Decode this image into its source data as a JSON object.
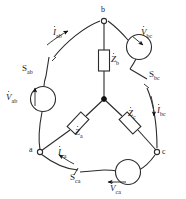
{
  "diagram": {
    "background_color": "#ffffff",
    "line_color": "#2b2b2b",
    "nodes": [
      {
        "id": "b",
        "label": "b",
        "type": "open-terminal",
        "x": 104,
        "y": 19
      },
      {
        "id": "a",
        "label": "a",
        "type": "open-terminal",
        "x": 39,
        "y": 152
      },
      {
        "id": "c",
        "label": "c",
        "type": "open-terminal",
        "x": 157,
        "y": 152
      },
      {
        "id": "n",
        "label": "",
        "type": "junction-dot",
        "x": 104,
        "y": 99
      }
    ],
    "sources": [
      {
        "id": "vab",
        "label": "V",
        "sub": "ab",
        "polarity_arrow": "up",
        "x": 43,
        "y": 99
      },
      {
        "id": "vbc",
        "label": "V",
        "sub": "bc",
        "polarity_arrow": "down-right",
        "x": 139,
        "y": 47
      },
      {
        "id": "vca",
        "label": "V",
        "sub": "ca",
        "polarity_arrow": "left",
        "x": 128,
        "y": 172
      }
    ],
    "impedances": [
      {
        "id": "zb",
        "label": "Z",
        "sub": "b",
        "orientation": "vertical",
        "x": 104,
        "y": 60
      },
      {
        "id": "za",
        "label": "Z",
        "sub": "a",
        "orientation": "diagonal-down-left",
        "x": 78,
        "y": 123
      },
      {
        "id": "zc",
        "label": "Z",
        "sub": "c",
        "orientation": "diagonal-down-right",
        "x": 130,
        "y": 123
      }
    ],
    "switches": [
      {
        "id": "sab",
        "label": "S",
        "sub": "ab",
        "x": 28,
        "y": 70
      },
      {
        "id": "sbc",
        "label": "S",
        "sub": "bc",
        "x": 152,
        "y": 76
      },
      {
        "id": "sca",
        "label": "S",
        "sub": "ca",
        "x": 84,
        "y": 176
      }
    ],
    "currents": [
      {
        "id": "iab",
        "label": "I",
        "sub": "ab",
        "direction": "toward-b",
        "x": 57,
        "y": 24
      },
      {
        "id": "ibc",
        "label": "I",
        "sub": "bc",
        "direction": "toward-c",
        "x": 153,
        "y": 111
      },
      {
        "id": "ica",
        "label": "I",
        "sub": "ca",
        "direction": "toward-a",
        "x": 62,
        "y": 153
      }
    ]
  }
}
